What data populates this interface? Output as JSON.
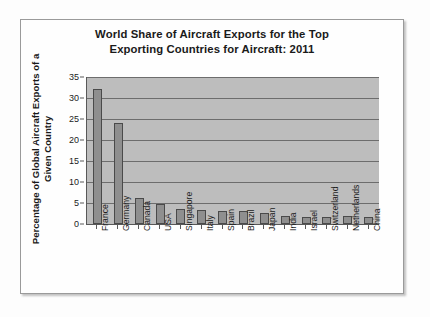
{
  "chart_data": {
    "type": "bar",
    "title": "World Share of Aircraft Exports for the Top Exporting Countries for Aircraft: 2011",
    "title_line1": "World Share of Aircraft Exports for the Top",
    "title_line2": "Exporting Countries for Aircraft: 2011",
    "xlabel": "",
    "ylabel": "Percentage of Global Aircraft Exports of a Given Country",
    "ylabel_line1": "Percentage of Global Aircraft Exports of a",
    "ylabel_line2": "Given Country",
    "ylim": [
      0,
      35
    ],
    "ytick_labels": [
      "35",
      "30",
      "25",
      "20",
      "15",
      "10",
      "5",
      "0"
    ],
    "ytick_values": [
      35,
      30,
      25,
      20,
      15,
      10,
      5,
      0
    ],
    "grid": true,
    "legend": "none",
    "categories": [
      "France",
      "Germany",
      "Canada",
      "USA",
      "Singapore",
      "Italy",
      "Spain",
      "Brazil",
      "Japan",
      "India",
      "Israel",
      "Switzerland",
      "Netherlands",
      "China"
    ],
    "values": [
      32.1,
      24.1,
      6.2,
      4.8,
      3.5,
      3.4,
      3.1,
      3.1,
      2.7,
      1.9,
      1.7,
      1.7,
      1.8,
      1.7
    ],
    "bar_color": "#8f8f8f",
    "bar_edge_color": "#4a4a4a",
    "plot_background": "#bdbdbd",
    "gridline_color": "#6d6d6d",
    "axis_color": "#585858"
  }
}
